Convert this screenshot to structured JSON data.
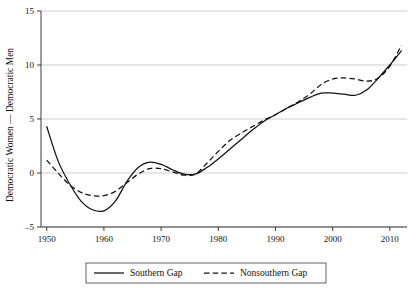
{
  "chart_data": {
    "type": "line",
    "title": "",
    "xlabel": "",
    "ylabel": "Democratic Women — Democratic Men",
    "xlim": [
      1949,
      2013
    ],
    "ylim": [
      -5,
      15
    ],
    "xticks": [
      1950,
      1960,
      1970,
      1980,
      1990,
      2000,
      2010
    ],
    "xticklabels": [
      "1950",
      "1960",
      "1970",
      "1980",
      "1990",
      "2000",
      "2010"
    ],
    "yticks": [
      -5,
      0,
      5,
      10,
      15
    ],
    "yticklabels": [
      "–5",
      "0",
      "5",
      "10",
      "15"
    ],
    "grid": "horizontal",
    "legend_position": "below-center",
    "x": [
      1950,
      1952,
      1954,
      1956,
      1958,
      1960,
      1962,
      1964,
      1966,
      1968,
      1970,
      1972,
      1974,
      1976,
      1978,
      1980,
      1982,
      1984,
      1986,
      1988,
      1990,
      1992,
      1994,
      1996,
      1998,
      2000,
      2002,
      2004,
      2006,
      2008,
      2010,
      2012
    ],
    "series": [
      {
        "name": "Southern Gap",
        "style": "solid",
        "values": [
          4.3,
          1.1,
          -1.0,
          -2.6,
          -3.4,
          -3.5,
          -2.6,
          -0.8,
          0.5,
          1.0,
          0.8,
          0.3,
          -0.1,
          -0.1,
          0.5,
          1.3,
          2.2,
          3.1,
          4.0,
          4.8,
          5.4,
          6.0,
          6.5,
          7.0,
          7.4,
          7.4,
          7.3,
          7.2,
          7.7,
          8.8,
          10.0,
          11.3
        ]
      },
      {
        "name": "Nonsouthern Gap",
        "style": "dashed",
        "values": [
          1.2,
          0.0,
          -1.1,
          -1.8,
          -2.1,
          -2.1,
          -1.7,
          -0.9,
          -0.1,
          0.4,
          0.4,
          0.1,
          -0.2,
          -0.1,
          0.9,
          2.0,
          3.0,
          3.7,
          4.3,
          4.9,
          5.4,
          6.0,
          6.6,
          7.3,
          8.2,
          8.7,
          8.8,
          8.7,
          8.5,
          8.8,
          9.9,
          11.8
        ]
      }
    ]
  },
  "legend": {
    "entries": [
      {
        "label": "Southern Gap",
        "style": "solid"
      },
      {
        "label": "Nonsouthern Gap",
        "style": "dashed"
      }
    ]
  }
}
